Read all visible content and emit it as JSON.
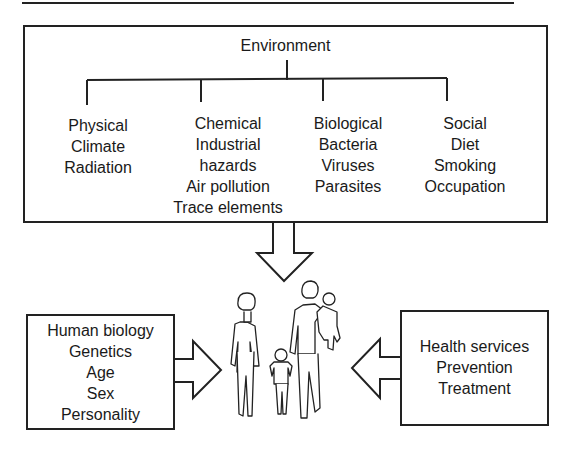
{
  "diagram": {
    "environment": {
      "title": "Environment",
      "categories": [
        {
          "heading": "Physical",
          "items": [
            "Climate",
            "Radiation"
          ]
        },
        {
          "heading": "Chemical",
          "items": [
            "Industrial",
            "hazards",
            "Air pollution",
            "Trace elements"
          ]
        },
        {
          "heading": "Biological",
          "items": [
            "Bacteria",
            "Viruses",
            "Parasites"
          ]
        },
        {
          "heading": "Social",
          "items": [
            "Diet",
            "Smoking",
            "Occupation"
          ]
        }
      ]
    },
    "human_biology": {
      "lines": [
        "Human biology",
        "Genetics",
        "Age",
        "Sex",
        "Personality"
      ]
    },
    "health_services": {
      "lines": [
        "Health services",
        "Prevention",
        "Treatment"
      ]
    },
    "center_illustration": "family-of-four-walking",
    "arrows": [
      {
        "from": "environment",
        "to": "family",
        "direction": "down"
      },
      {
        "from": "human_biology",
        "to": "family",
        "direction": "right"
      },
      {
        "from": "health_services",
        "to": "family",
        "direction": "left"
      }
    ]
  }
}
